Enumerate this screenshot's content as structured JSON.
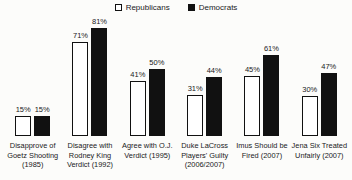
{
  "legend": {
    "items": [
      {
        "label": "Republicans",
        "swatch": "open-square",
        "fill": "#ffffff",
        "border": "#111111"
      },
      {
        "label": "Democrats",
        "swatch": "filled-square",
        "fill": "#111111",
        "border": "#111111"
      }
    ],
    "position": "top-center"
  },
  "chart_data": {
    "type": "bar",
    "categories": [
      "Disapprove of Goetz Shooting (1985)",
      "Disagree with Rodney King Verdict (1992)",
      "Agree with O.J. Verdict (1995)",
      "Duke LaCross Players' Guilty (2006/2007)",
      "Imus Should be Fired (2007)",
      "Jena Six Treated Unfairly (2007)"
    ],
    "series": [
      {
        "name": "Republicans",
        "values": [
          15,
          71,
          41,
          31,
          45,
          30
        ],
        "fill": "#ffffff",
        "border": "#111111"
      },
      {
        "name": "Democrats",
        "values": [
          15,
          81,
          50,
          44,
          61,
          47
        ],
        "fill": "#111111",
        "border": "#111111"
      }
    ],
    "data_labels": {
      "Republicans": [
        "15%",
        "71%",
        "41%",
        "31%",
        "45%",
        "30%"
      ],
      "Democrats": [
        "15%",
        "81%",
        "50%",
        "44%",
        "61%",
        "47%"
      ]
    },
    "value_suffix": "%",
    "title": "",
    "xlabel": "",
    "ylabel": "",
    "axis_visible": false,
    "grid": false,
    "legend_position": "top"
  }
}
